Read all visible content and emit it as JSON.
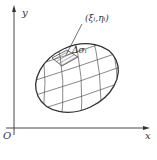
{
  "diagram": {
    "axes": {
      "x_label": "x",
      "y_label": "y",
      "origin_label": "O"
    },
    "region": {
      "point_label": "(ξᵢ,ηᵢ)",
      "area_label": "Δσᵢ"
    },
    "colors": {
      "stroke": "#333333",
      "grid": "#555555",
      "background": "#ffffff"
    }
  }
}
